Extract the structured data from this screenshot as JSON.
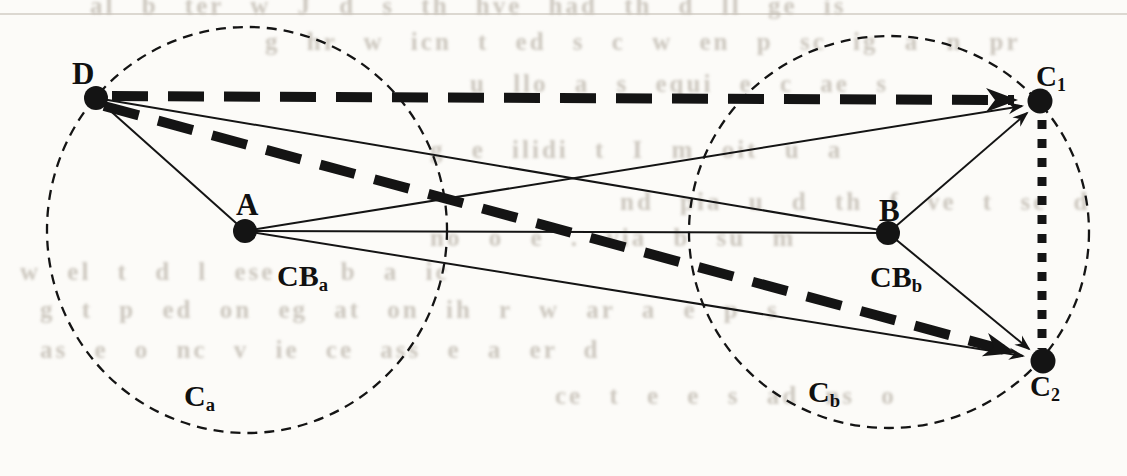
{
  "figure": {
    "colors": {
      "ink": "#141414",
      "paper": "#fcfbf8",
      "ghost_text": "#bfb9af"
    },
    "clusters": {
      "ca": {
        "label_main": "C",
        "label_sub": "a"
      },
      "cb": {
        "label_main": "C",
        "label_sub": "b"
      }
    },
    "points": {
      "d": {
        "label": "D"
      },
      "a": {
        "label": "A"
      },
      "b": {
        "label": "B"
      },
      "c1": {
        "label_main": "C",
        "label_sub": "1"
      },
      "c2": {
        "label_main": "C",
        "label_sub": "2"
      }
    },
    "center_labels": {
      "cba": {
        "label_main": "CB",
        "label_sub": "a"
      },
      "cbb": {
        "label_main": "CB",
        "label_sub": "b"
      }
    },
    "edges": [
      {
        "from": "D",
        "to": "C1",
        "style": "thick-dashed-arrow"
      },
      {
        "from": "D",
        "to": "C2",
        "style": "thick-dashed-arrow"
      },
      {
        "from": "C1",
        "to": "C2",
        "style": "thick-dotted"
      },
      {
        "from": "D",
        "to": "A",
        "style": "thin-solid"
      },
      {
        "from": "D",
        "to": "B",
        "style": "thin-solid"
      },
      {
        "from": "A",
        "to": "B",
        "style": "thin-solid"
      },
      {
        "from": "A",
        "to": "C1",
        "style": "thin-solid-arrow"
      },
      {
        "from": "A",
        "to": "C2",
        "style": "thin-solid-arrow"
      },
      {
        "from": "B",
        "to": "C1",
        "style": "thin-solid-arrow"
      },
      {
        "from": "B",
        "to": "C2",
        "style": "thin-solid-arrow"
      }
    ]
  },
  "bleedthrough": {
    "rows": [
      {
        "text": "al b ter  w  J d  s th  hve had  th  d  ll  ge  is"
      },
      {
        "text": "g hr  w icn t  ed s  c  w en p sc ig  a  n  pr"
      },
      {
        "text": "u llo  a  s  equi  e  c  ae s"
      },
      {
        "text": "g e ilidi  t  I   m oit  u  a"
      },
      {
        "text": "nd pia  u  d th  f ve t  se  d"
      },
      {
        "text": "no   o e  .  via b  su   m"
      },
      {
        "text": "w  el  t  d   l  ese  s  b  a   ic"
      },
      {
        "text": "g t p ed on  eg at on   ih r  w  ar a  e p   s"
      },
      {
        "text": "as e o  nc  v ie  ce ass  e  a  er   d"
      },
      {
        "text": "ce t   e e  s ad   ns    o"
      }
    ]
  }
}
